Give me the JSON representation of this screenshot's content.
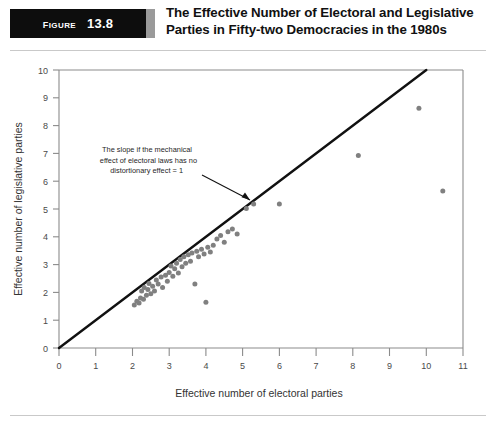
{
  "header": {
    "badge_word": "Figure",
    "badge_number": "13.8",
    "title_line1": "The Effective Number of Electoral and Legislative",
    "title_line2": "Parties in Fifty-two Democracies in the 1980s",
    "title_full": "The Effective Number of Electoral and Legislative Parties in Fifty-two Democracies in the 1980s"
  },
  "colors": {
    "badge_background": "#0d0d0d",
    "badge_text": "#ffffff",
    "dot": "#808080",
    "line": "#111111",
    "axis": "#8b8b8b",
    "page_background": "#ffffff"
  },
  "annotation": {
    "line1": "The slope if the mechanical",
    "line2": "effect of electoral laws has no",
    "line3": "distortionary effect = 1"
  },
  "chart_data": {
    "type": "scatter",
    "title": "The Effective Number of Electoral and Legislative Parties in Fifty-two Democracies in the 1980s",
    "xlabel": "Effective number of electoral parties",
    "ylabel": "Effective number of legislative parties",
    "xlim": [
      0,
      11
    ],
    "ylim": [
      0,
      10
    ],
    "xticks": [
      0,
      1,
      2,
      3,
      4,
      5,
      6,
      7,
      8,
      9,
      10,
      11
    ],
    "yticks": [
      0,
      1,
      2,
      3,
      4,
      5,
      6,
      7,
      8,
      9,
      10
    ],
    "grid": false,
    "legend": null,
    "reference_line": {
      "label": "The slope if the mechanical effect of electoral laws has no distortionary effect = 1",
      "slope": 1,
      "intercept": 0,
      "from": [
        0,
        0
      ],
      "to": [
        10,
        10
      ]
    },
    "points": [
      [
        2.05,
        1.55
      ],
      [
        2.12,
        1.68
      ],
      [
        2.18,
        1.62
      ],
      [
        2.22,
        1.8
      ],
      [
        2.25,
        2.05
      ],
      [
        2.3,
        1.75
      ],
      [
        2.32,
        2.18
      ],
      [
        2.38,
        1.9
      ],
      [
        2.42,
        2.1
      ],
      [
        2.45,
        2.32
      ],
      [
        2.5,
        1.95
      ],
      [
        2.55,
        2.22
      ],
      [
        2.6,
        2.05
      ],
      [
        2.65,
        2.45
      ],
      [
        2.7,
        2.3
      ],
      [
        2.78,
        2.55
      ],
      [
        2.82,
        2.18
      ],
      [
        2.9,
        2.62
      ],
      [
        2.95,
        2.4
      ],
      [
        3.0,
        2.72
      ],
      [
        3.05,
        2.95
      ],
      [
        3.1,
        2.58
      ],
      [
        3.15,
        2.85
      ],
      [
        3.2,
        3.05
      ],
      [
        3.25,
        2.7
      ],
      [
        3.3,
        3.18
      ],
      [
        3.35,
        2.92
      ],
      [
        3.4,
        3.28
      ],
      [
        3.45,
        3.05
      ],
      [
        3.52,
        3.35
      ],
      [
        3.58,
        3.12
      ],
      [
        3.62,
        3.42
      ],
      [
        3.7,
        2.3
      ],
      [
        3.75,
        3.48
      ],
      [
        3.8,
        3.28
      ],
      [
        3.88,
        3.55
      ],
      [
        3.95,
        3.38
      ],
      [
        4.0,
        1.65
      ],
      [
        4.05,
        3.62
      ],
      [
        4.12,
        3.45
      ],
      [
        4.2,
        3.7
      ],
      [
        4.3,
        3.92
      ],
      [
        4.4,
        4.05
      ],
      [
        4.5,
        3.8
      ],
      [
        4.6,
        4.18
      ],
      [
        4.72,
        4.28
      ],
      [
        4.85,
        4.1
      ],
      [
        5.1,
        5.02
      ],
      [
        5.3,
        5.18
      ],
      [
        6.0,
        5.18
      ],
      [
        8.15,
        6.92
      ],
      [
        9.8,
        8.62
      ],
      [
        10.45,
        5.65
      ]
    ]
  }
}
